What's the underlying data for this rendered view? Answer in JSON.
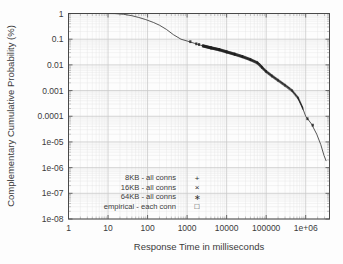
{
  "chart_data": {
    "type": "line",
    "title": "",
    "xlabel": "Response Time in milliseconds",
    "ylabel": "Complementary Cumulative Probability (%)",
    "xscale": "log",
    "yscale": "log",
    "xlim": [
      1,
      4000000
    ],
    "ylim": [
      1e-08,
      1
    ],
    "grid": true,
    "legend_position": "lower-left-center",
    "xticks": [
      {
        "value": 1,
        "label": "1"
      },
      {
        "value": 10,
        "label": "10"
      },
      {
        "value": 100,
        "label": "100"
      },
      {
        "value": 1000,
        "label": "1000"
      },
      {
        "value": 10000,
        "label": "10000"
      },
      {
        "value": 100000,
        "label": "100000"
      },
      {
        "value": 1000000,
        "label": "1e+06"
      }
    ],
    "yticks": [
      {
        "value": 1,
        "label": "1"
      },
      {
        "value": 0.1,
        "label": "0.1"
      },
      {
        "value": 0.01,
        "label": "0.01"
      },
      {
        "value": 0.001,
        "label": "0.001"
      },
      {
        "value": 0.0001,
        "label": "0.0001"
      },
      {
        "value": 1e-05,
        "label": "1e-05"
      },
      {
        "value": 1e-06,
        "label": "1e-06"
      },
      {
        "value": 1e-07,
        "label": "1e-07"
      },
      {
        "value": 1e-08,
        "label": "1e-08"
      }
    ],
    "series": [
      {
        "name": "8KB - all conns",
        "marker": "+",
        "marker_glyph": "+",
        "color": "#2e2e2e"
      },
      {
        "name": "16KB - all conns",
        "marker": "x",
        "marker_glyph": "×",
        "color": "#2e2e2e"
      },
      {
        "name": "64KB - all conns",
        "marker": "star",
        "marker_glyph": "∗",
        "color": "#2e2e2e"
      },
      {
        "name": "empirical - each conn",
        "marker": "open-square",
        "marker_glyph": "□",
        "color": "#2e2e2e"
      }
    ],
    "curve_points": [
      {
        "x": 1,
        "y": 1.0
      },
      {
        "x": 3,
        "y": 1.0
      },
      {
        "x": 8,
        "y": 1.0
      },
      {
        "x": 15,
        "y": 0.99
      },
      {
        "x": 25,
        "y": 0.93
      },
      {
        "x": 40,
        "y": 0.82
      },
      {
        "x": 60,
        "y": 0.7
      },
      {
        "x": 90,
        "y": 0.58
      },
      {
        "x": 140,
        "y": 0.45
      },
      {
        "x": 200,
        "y": 0.35
      },
      {
        "x": 300,
        "y": 0.24
      },
      {
        "x": 450,
        "y": 0.15
      },
      {
        "x": 700,
        "y": 0.1
      },
      {
        "x": 1000,
        "y": 0.085
      },
      {
        "x": 1500,
        "y": 0.07
      },
      {
        "x": 2200,
        "y": 0.058
      },
      {
        "x": 3200,
        "y": 0.05
      },
      {
        "x": 5000,
        "y": 0.042
      },
      {
        "x": 8000,
        "y": 0.035
      },
      {
        "x": 13000,
        "y": 0.028
      },
      {
        "x": 20000,
        "y": 0.023
      },
      {
        "x": 32000,
        "y": 0.018
      },
      {
        "x": 50000,
        "y": 0.014
      },
      {
        "x": 70000,
        "y": 0.011
      },
      {
        "x": 90000,
        "y": 0.0065
      },
      {
        "x": 120000,
        "y": 0.0045
      },
      {
        "x": 170000,
        "y": 0.003
      },
      {
        "x": 250000,
        "y": 0.002
      },
      {
        "x": 400000,
        "y": 0.0012
      },
      {
        "x": 600000,
        "y": 0.0006
      },
      {
        "x": 800000,
        "y": 0.00025
      },
      {
        "x": 1000000,
        "y": 0.0001
      },
      {
        "x": 1400000,
        "y": 5e-05
      },
      {
        "x": 1900000,
        "y": 2e-05
      },
      {
        "x": 2400000,
        "y": 8e-06
      },
      {
        "x": 2900000,
        "y": 3e-06
      },
      {
        "x": 3300000,
        "y": 1.8e-06
      }
    ],
    "marker_band": [
      {
        "x": 2500,
        "y": 0.055
      },
      {
        "x": 4000,
        "y": 0.046
      },
      {
        "x": 6500,
        "y": 0.039
      },
      {
        "x": 10000,
        "y": 0.032
      },
      {
        "x": 16000,
        "y": 0.026
      },
      {
        "x": 25000,
        "y": 0.021
      },
      {
        "x": 40000,
        "y": 0.016
      },
      {
        "x": 60000,
        "y": 0.012
      },
      {
        "x": 78000,
        "y": 0.008
      },
      {
        "x": 100000,
        "y": 0.0055
      },
      {
        "x": 140000,
        "y": 0.0037
      },
      {
        "x": 200000,
        "y": 0.0025
      },
      {
        "x": 300000,
        "y": 0.0016
      },
      {
        "x": 450000,
        "y": 0.001
      },
      {
        "x": 650000,
        "y": 0.0005
      },
      {
        "x": 850000,
        "y": 0.0002
      }
    ]
  }
}
